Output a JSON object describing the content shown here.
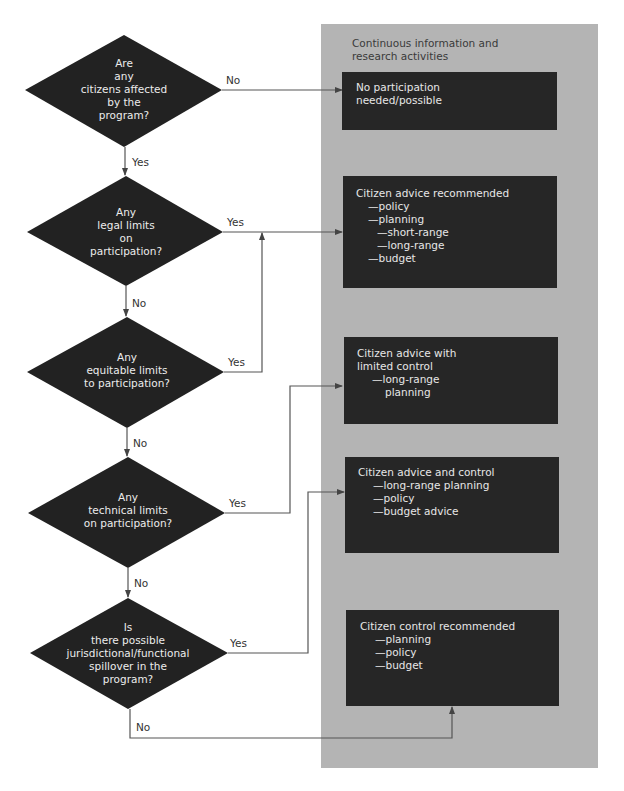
{
  "panel": {
    "title_lines": [
      "Continuous information and",
      "research activities"
    ],
    "color": "#b4b4b4"
  },
  "decisions": [
    {
      "id": "d1",
      "lines": [
        "Are",
        "any",
        "citizens affected",
        "by the",
        "program?"
      ],
      "yes_label": "Yes",
      "no_label": "No"
    },
    {
      "id": "d2",
      "lines": [
        "Any",
        "legal limits",
        "on",
        "participation?"
      ],
      "yes_label": "Yes",
      "no_label": "No"
    },
    {
      "id": "d3",
      "lines": [
        "Any",
        "equitable limits",
        "to participation?"
      ],
      "yes_label": "Yes",
      "no_label": "No"
    },
    {
      "id": "d4",
      "lines": [
        "Any",
        "technical limits",
        "on participation?"
      ],
      "yes_label": "Yes",
      "no_label": "No"
    },
    {
      "id": "d5",
      "lines": [
        "Is",
        "there possible",
        "jurisdictional/functional",
        "spillover in the",
        "program?"
      ],
      "yes_label": "Yes",
      "no_label": "No"
    }
  ],
  "outcomes": [
    {
      "id": "o1",
      "title": [
        "No participation",
        "needed/possible"
      ],
      "items": []
    },
    {
      "id": "o2",
      "title": [
        "Citizen advice recommended"
      ],
      "items": [
        "—policy",
        "—planning",
        "—short-range",
        "—long-range",
        "—budget"
      ]
    },
    {
      "id": "o3",
      "title": [
        "Citizen advice with",
        "limited control"
      ],
      "items": [
        "—long-range",
        "planning"
      ]
    },
    {
      "id": "o4",
      "title": [
        "Citizen advice and control"
      ],
      "items": [
        "—long-range planning",
        "—policy",
        "—budget advice"
      ]
    },
    {
      "id": "o5",
      "title": [
        "Citizen control recommended"
      ],
      "items": [
        "—planning",
        "—policy",
        "—budget"
      ]
    }
  ],
  "colors": {
    "diamond_fill": "#222222",
    "box_fill": "#262626",
    "line": "#555555",
    "box_text": "#e6e6e6"
  }
}
